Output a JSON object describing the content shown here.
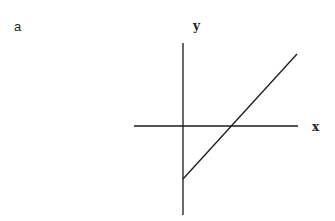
{
  "figure": {
    "panel_label": "a",
    "x_axis_label": "x",
    "y_axis_label": "y",
    "line_color": "#1a1a1a"
  },
  "geometry": {
    "y_axis": {
      "x": 183,
      "y1": 43,
      "y2": 215
    },
    "x_axis": {
      "y": 126,
      "x1": 134,
      "x2": 298
    },
    "line": {
      "x1": 183,
      "y1": 179,
      "x2": 297,
      "y2": 54
    },
    "x_intercept_px": 232
  }
}
